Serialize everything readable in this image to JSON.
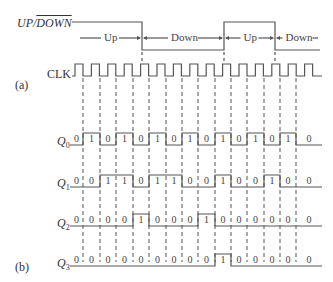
{
  "labels": {
    "updown_prefix": "UP/",
    "updown_bar": "DOWN",
    "clk": "CLK",
    "part_a": "(a)",
    "part_b": "(b)",
    "q0": "Q",
    "q0_sub": "0",
    "q1": "Q",
    "q1_sub": "1",
    "q2": "Q",
    "q2_sub": "2",
    "q3": "Q",
    "q3_sub": "3"
  },
  "regions": [
    {
      "label": "Up",
      "x1": 78,
      "x2": 142
    },
    {
      "label": "Down",
      "x1": 142,
      "x2": 224
    },
    {
      "label": "Up",
      "x1": 224,
      "x2": 275
    },
    {
      "label": "Down",
      "x1": 275,
      "x2": 320
    }
  ],
  "colors": {
    "line": "#555555",
    "text": "#333333",
    "dash": "#555555"
  },
  "timing": {
    "clock_edges_x": [
      83,
      100,
      116,
      133,
      149,
      166,
      182,
      198,
      215,
      231,
      247,
      264,
      280,
      296
    ],
    "updown_transitions_x": [
      142,
      224,
      275
    ],
    "Q0": [
      "0",
      "1",
      "0",
      "1",
      "0",
      "1",
      "0",
      "1",
      "0",
      "1",
      "0",
      "1",
      "0",
      "1",
      "0"
    ],
    "Q1": [
      "0",
      "0",
      "1",
      "1",
      "0",
      "1",
      "1",
      "0",
      "0",
      "1",
      "0",
      "0",
      "1",
      "0",
      "0"
    ],
    "Q2": [
      "0",
      "0",
      "0",
      "0",
      "1",
      "0",
      "0",
      "0",
      "1",
      "0",
      "0",
      "0",
      "0",
      "0",
      "0"
    ],
    "Q3": [
      "0",
      "0",
      "0",
      "0",
      "0",
      "0",
      "0",
      "0",
      "0",
      "1",
      "0",
      "0",
      "0",
      "0",
      "0"
    ]
  }
}
